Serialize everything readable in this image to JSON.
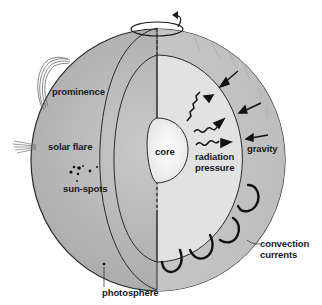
{
  "diagram": {
    "labels": {
      "prominence": "prominence",
      "solar_flare": "solar flare",
      "sun_spots": "sun-spots",
      "photosphere": "photosphere",
      "core": "core",
      "radiation_line1": "radiation",
      "radiation_line2": "pressure",
      "gravity": "gravity",
      "convection_line1": "convection",
      "convection_line2": "currents"
    },
    "icons": [
      "rotation-arrow-icon",
      "gravity-arrow-icon",
      "radiation-wave-arrow-icon"
    ],
    "colors": {
      "surface": "#b8b8b8",
      "convection_zone": "#c4c4c4",
      "radiative_zone": "#e0e0e0",
      "core": "#f2f2f2",
      "outline": "#2a2a2a"
    }
  }
}
